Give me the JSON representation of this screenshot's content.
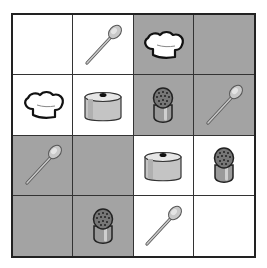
{
  "board": {
    "rows": 4,
    "cols": 4,
    "colors": {
      "white": "#ffffff",
      "gray": "#a3a3a3",
      "grid_line": "#333333"
    },
    "cells": [
      [
        {
          "shade": "white",
          "icon": "empty"
        },
        {
          "shade": "white",
          "icon": "spoon"
        },
        {
          "shade": "gray",
          "icon": "chef-hat"
        },
        {
          "shade": "gray",
          "icon": "empty"
        }
      ],
      [
        {
          "shade": "white",
          "icon": "chef-hat"
        },
        {
          "shade": "white",
          "icon": "pot"
        },
        {
          "shade": "gray",
          "icon": "salt-shaker"
        },
        {
          "shade": "gray",
          "icon": "spoon"
        }
      ],
      [
        {
          "shade": "gray",
          "icon": "spoon"
        },
        {
          "shade": "gray",
          "icon": "empty"
        },
        {
          "shade": "white",
          "icon": "pot"
        },
        {
          "shade": "white",
          "icon": "salt-shaker"
        }
      ],
      [
        {
          "shade": "gray",
          "icon": "empty"
        },
        {
          "shade": "gray",
          "icon": "salt-shaker"
        },
        {
          "shade": "white",
          "icon": "spoon"
        },
        {
          "shade": "white",
          "icon": "empty"
        }
      ]
    ]
  }
}
